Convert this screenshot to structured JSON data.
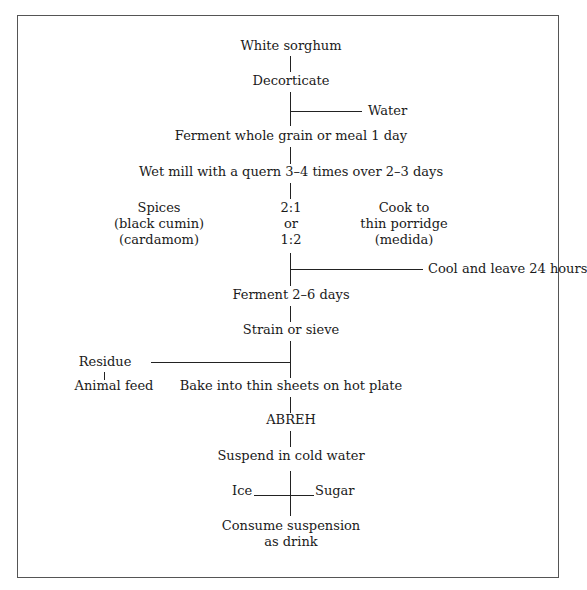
{
  "header": {
    "cropped_heading": "SAUDI ARABIA"
  },
  "diagram": {
    "title_node": "White sorghum",
    "steps": {
      "decorticate": "Decorticate",
      "water": "Water",
      "ferment1": "Ferment whole grain or meal 1 day",
      "wetmill": "Wet mill with a quern 3–4 times over 2–3 days",
      "spices": [
        "Spices",
        "(black cumin)",
        "(cardamom)"
      ],
      "ratio": [
        "2:1",
        "or",
        "1:2"
      ],
      "cook": [
        "Cook to",
        "thin porridge",
        "(medida)"
      ],
      "cool": "Cool and leave 24 hours",
      "ferment2": "Ferment 2–6 days",
      "strain": "Strain or sieve",
      "residue": "Residue",
      "animal_feed": "Animal feed",
      "bake": "Bake into thin sheets on hot plate",
      "abreh": "ABREH",
      "suspend": "Suspend in cold water",
      "ice": "Ice",
      "sugar": "Sugar",
      "consume": [
        "Consume suspension",
        "as drink"
      ]
    }
  }
}
